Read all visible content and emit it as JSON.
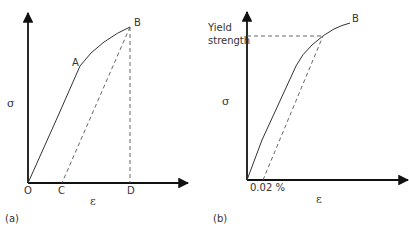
{
  "diagram": {
    "type": "stress-strain curves",
    "panels": [
      {
        "id": "a",
        "caption": "(a)",
        "y_axis_label": "σ",
        "x_axis_label": "ε",
        "points": {
          "origin": "O",
          "proportional_limit": "A",
          "end_point": "B",
          "unload_intercept": "C",
          "projection": "D"
        },
        "lines": [
          {
            "name": "stress-strain curve",
            "from": "O",
            "via": "A",
            "to": "B",
            "style": "solid"
          },
          {
            "name": "unloading line",
            "from": "B",
            "to": "C",
            "style": "dashed"
          },
          {
            "name": "projection line",
            "from": "B",
            "to": "D",
            "style": "dashed"
          }
        ]
      },
      {
        "id": "b",
        "caption": "(b)",
        "y_axis_label": "σ",
        "x_axis_label": "ε",
        "yield_label_line1": "Yield",
        "yield_label_line2": "strength",
        "offset_label": "0.02 %",
        "end_point": "B",
        "lines": [
          {
            "name": "stress-strain curve",
            "style": "solid"
          },
          {
            "name": "offset line",
            "style": "dashed",
            "offset": "0.02 %"
          },
          {
            "name": "yield strength level",
            "style": "dashed"
          }
        ]
      }
    ],
    "colors": {
      "axis": "#111111",
      "curve": "#333333",
      "dashed": "#555555",
      "text": "#333333"
    }
  }
}
